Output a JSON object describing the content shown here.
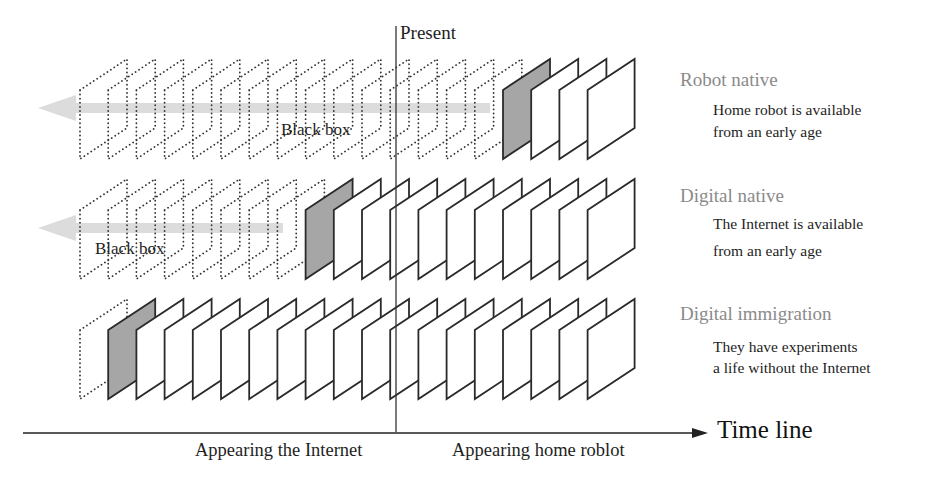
{
  "present_label": "Present",
  "timeline": {
    "axis_label": "Time line",
    "markers": [
      {
        "label": "Appearing the Internet"
      },
      {
        "label": "Appearing home roblot"
      }
    ]
  },
  "rows": [
    {
      "name": "Robot native",
      "description_lines": [
        "Home robot is available",
        "from an early age"
      ],
      "black_box_label": "Black box",
      "total_frames": 19,
      "first_solid_index": 15
    },
    {
      "name": "Digital native",
      "description_lines": [
        "The Internet is available",
        "from an early age"
      ],
      "black_box_label": "Black box",
      "total_frames": 19,
      "first_solid_index": 8
    },
    {
      "name": "Digital immigration",
      "description_lines": [
        "They have experiments",
        "a life without the Internet"
      ],
      "black_box_label": "",
      "total_frames": 19,
      "first_solid_index": 1
    }
  ],
  "colors": {
    "frame_stroke": "#2a2a2a",
    "first_frame_fill": "#a6a6a6",
    "arrow_fill": "#dcdcdc",
    "category_text": "#8a8a8a"
  }
}
